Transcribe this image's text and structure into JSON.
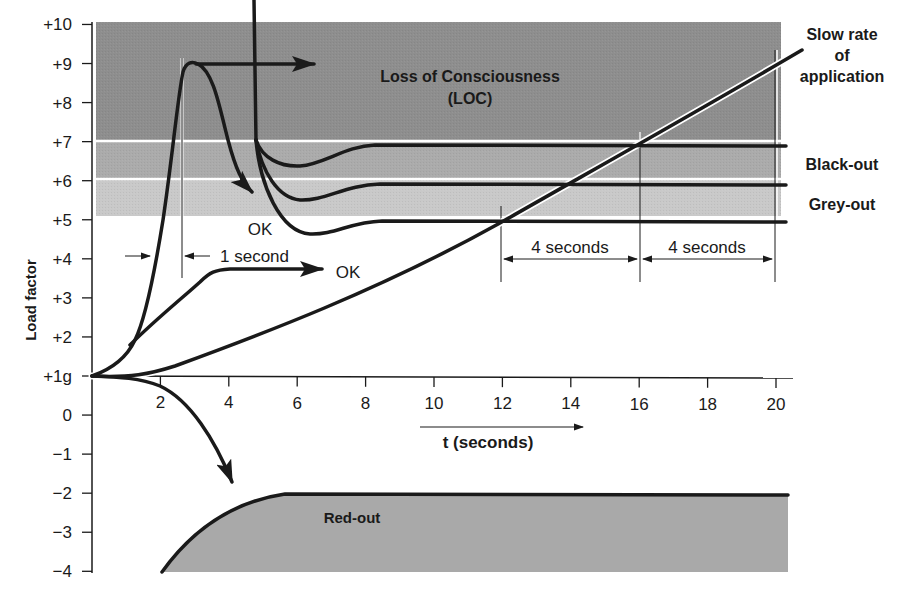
{
  "chart_data": {
    "type": "line",
    "title": "",
    "xlabel": "t (seconds)",
    "ylabel": "Load factor",
    "xlim": [
      0,
      20.5
    ],
    "ylim": [
      -4,
      10
    ],
    "x_ticks": [
      2,
      4,
      6,
      8,
      10,
      12,
      14,
      16,
      18,
      20
    ],
    "y_ticks": [
      {
        "value": 10,
        "label": "+10"
      },
      {
        "value": 9,
        "label": "+9"
      },
      {
        "value": 8,
        "label": "+8"
      },
      {
        "value": 7,
        "label": "+7"
      },
      {
        "value": 6,
        "label": "+6"
      },
      {
        "value": 5,
        "label": "+5"
      },
      {
        "value": 4,
        "label": "+4"
      },
      {
        "value": 3,
        "label": "+3"
      },
      {
        "value": 2,
        "label": "+2"
      },
      {
        "value": 1,
        "label": "+1g"
      },
      {
        "value": 0,
        "label": "0"
      },
      {
        "value": -1,
        "label": "−1"
      },
      {
        "value": -2,
        "label": "−2"
      },
      {
        "value": -3,
        "label": "−3"
      },
      {
        "value": -4,
        "label": "−4"
      }
    ],
    "regions": [
      {
        "name": "Loss of Consciousness (LOC)",
        "y_range": [
          7,
          10
        ],
        "x_range": [
          0,
          20.2
        ],
        "color": "#8c8c8c"
      },
      {
        "name": "Black-out",
        "y_range": [
          6,
          7
        ],
        "x_range": [
          0,
          20.2
        ],
        "color": "#aaaaaa"
      },
      {
        "name": "Grey-out",
        "y_range": [
          5,
          6
        ],
        "x_range": [
          0,
          20.2
        ],
        "color": "#c8c8c8"
      },
      {
        "name": "Red-out",
        "y_range": [
          -4,
          -2
        ],
        "x_range": [
          2,
          20.3
        ],
        "color": "#a9a9a9"
      }
    ],
    "series": [
      {
        "name": "Rapid onset peak (+9g, 1 second)",
        "points": [
          [
            0,
            1
          ],
          [
            1.2,
            2
          ],
          [
            1.8,
            4
          ],
          [
            2.3,
            7
          ],
          [
            2.7,
            8.8
          ],
          [
            3.0,
            9
          ],
          [
            3.4,
            8.6
          ],
          [
            3.9,
            7
          ],
          [
            4.4,
            5.6
          ],
          [
            4.7,
            5.2
          ]
        ],
        "end_label": "OK"
      },
      {
        "name": "Sustained +9g (arrow)",
        "points": [
          [
            3.0,
            9
          ],
          [
            6.3,
            9
          ]
        ]
      },
      {
        "name": "Moderate onset (OK)",
        "points": [
          [
            0,
            1
          ],
          [
            1.2,
            2
          ],
          [
            2.5,
            3.2
          ],
          [
            3.4,
            3.7
          ],
          [
            6.0,
            3.7
          ]
        ],
        "end_label": "OK"
      },
      {
        "name": "Slow rate of application",
        "points": [
          [
            0,
            1
          ],
          [
            1.5,
            1.05
          ],
          [
            4,
            1.6
          ],
          [
            8,
            2.9
          ],
          [
            12,
            5
          ],
          [
            16,
            7
          ],
          [
            20.5,
            9.2
          ]
        ]
      },
      {
        "name": "Black-out threshold",
        "points": [
          [
            4.7,
            10.2
          ],
          [
            4.75,
            7
          ],
          [
            5.3,
            6.5
          ],
          [
            6.2,
            6.35
          ],
          [
            8.0,
            6.9
          ],
          [
            20.3,
            6.9
          ]
        ]
      },
      {
        "name": "Grey-out threshold",
        "points": [
          [
            4.75,
            7
          ],
          [
            5.3,
            6.0
          ],
          [
            6.3,
            5.6
          ],
          [
            8.2,
            5.9
          ],
          [
            20.3,
            5.9
          ]
        ]
      },
      {
        "name": "Grey-out onset lower",
        "points": [
          [
            4.75,
            7
          ],
          [
            5.5,
            5.0
          ],
          [
            6.4,
            4.65
          ],
          [
            8.4,
            4.95
          ],
          [
            20.3,
            4.95
          ]
        ]
      },
      {
        "name": "Negative g (arrow to red-out)",
        "points": [
          [
            0,
            1
          ],
          [
            1.2,
            0.95
          ],
          [
            2.5,
            0.3
          ],
          [
            3.5,
            -0.8
          ],
          [
            4.1,
            -1.8
          ]
        ]
      },
      {
        "name": "Red-out boundary",
        "points": [
          [
            2,
            -4
          ],
          [
            3.5,
            -2.6
          ],
          [
            5.5,
            -2
          ],
          [
            20.3,
            -2.05
          ]
        ]
      }
    ],
    "annotations": [
      {
        "text": "Loss of Consciousness",
        "x": 10.3,
        "y": 8.35
      },
      {
        "text": "(LOC)",
        "x": 10.3,
        "y": 7.75
      },
      {
        "text": "Slow rate",
        "x": 22.3,
        "y": 9.9
      },
      {
        "text": "of",
        "x": 22.3,
        "y": 9.3
      },
      {
        "text": "application",
        "x": 22.3,
        "y": 8.7
      },
      {
        "text": "Black-out",
        "x": 22.3,
        "y": 6.4
      },
      {
        "text": "Grey-out",
        "x": 22.3,
        "y": 5.4
      },
      {
        "text": "1 second",
        "x": 5.1,
        "y": 4.0
      },
      {
        "text": "4 seconds",
        "x": 14,
        "y": 4.3
      },
      {
        "text": "4 seconds",
        "x": 18,
        "y": 4.3
      },
      {
        "text": "OK",
        "x": 4.9,
        "y": 4.8
      },
      {
        "text": "OK",
        "x": 6.9,
        "y": 3.5
      },
      {
        "text": "Red-out",
        "x": 7.8,
        "y": -2.7
      }
    ],
    "interval_markers": [
      {
        "label": "1 second",
        "from": 1.9,
        "to": 2.65
      },
      {
        "label": "4 seconds",
        "from": 12,
        "to": 16
      },
      {
        "label": "4 seconds",
        "from": 16,
        "to": 20
      }
    ],
    "legend": null,
    "grid": false
  },
  "labels": {
    "loc_line1": "Loss of Consciousness",
    "loc_line2": "(LOC)",
    "slow_rate_1": "Slow rate",
    "slow_rate_2": "of",
    "slow_rate_3": "application",
    "blackout": "Black-out",
    "greyout": "Grey-out",
    "one_second": "1 second",
    "four_seconds_a": "4 seconds",
    "four_seconds_b": "4 seconds",
    "ok_upper": "OK",
    "ok_lower": "OK",
    "redout": "Red-out",
    "xlabel": "t (seconds)",
    "ylabel": "Load factor"
  }
}
